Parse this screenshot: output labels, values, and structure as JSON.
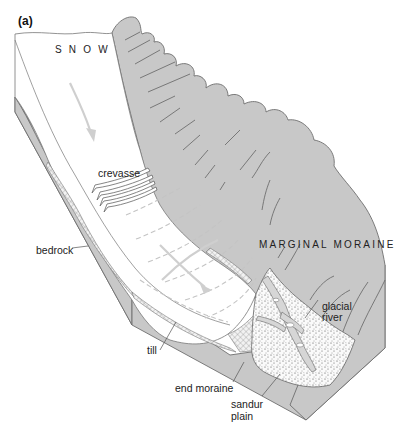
{
  "figure": {
    "panel_label": "(a)",
    "type": "block diagram of a valley glacier",
    "colors": {
      "rock_fill": "#c8c8c8",
      "rock_outline": "#6e6e6e",
      "ice_fill": "#ffffff",
      "flow_arrow": "#cfcfcf",
      "text": "#222222"
    }
  },
  "labels": {
    "snow": "S N O W",
    "crevasse": "crevasse",
    "bedrock": "bedrock",
    "marginal_moraine": "MARGINAL MORAINE",
    "glacial_river_line1": "glacial",
    "glacial_river_line2": "river",
    "till": "till",
    "end_moraine": "end moraine",
    "sandur_plain_line1": "sandur",
    "sandur_plain_line2": "plain"
  },
  "features": [
    {
      "name": "snow accumulation zone",
      "label": "SNOW"
    },
    {
      "name": "crevasses",
      "label": "crevasse"
    },
    {
      "name": "bedrock",
      "label": "bedrock"
    },
    {
      "name": "marginal moraine",
      "label": "MARGINAL MORAINE"
    },
    {
      "name": "glacial river",
      "label": "glacial river"
    },
    {
      "name": "till",
      "label": "till"
    },
    {
      "name": "end moraine",
      "label": "end moraine"
    },
    {
      "name": "sandur plain",
      "label": "sandur plain"
    },
    {
      "name": "ice flow arrows",
      "count": 2
    }
  ]
}
